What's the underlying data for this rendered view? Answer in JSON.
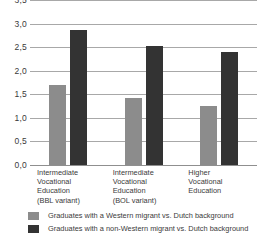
{
  "chart_data": {
    "type": "bar",
    "title": "",
    "xlabel": "",
    "ylabel": "",
    "ylim": [
      0,
      3.5
    ],
    "ytick_labels": [
      "3,5",
      "3,0",
      "2,5",
      "2,0",
      "1,5",
      "1,0",
      "0,5",
      "0,0"
    ],
    "ytick_values": [
      3.5,
      3.0,
      2.5,
      2.0,
      1.5,
      1.0,
      0.5,
      0.0
    ],
    "grid": true,
    "legend_position": "bottom",
    "decimal_separator": ",",
    "categories": [
      "Intermediate Vocational Education (BBL variant)",
      "Intermediate Vocational Education (BOL variant)",
      "Higher Vocational Education"
    ],
    "category_lines": [
      [
        "Intermediate",
        "Vocational",
        "Education",
        "(BBL variant)"
      ],
      [
        "Intermediate",
        "Vocational",
        "Education",
        "(BOL variant)"
      ],
      [
        "Higher",
        "Vocational",
        "Education"
      ]
    ],
    "series": [
      {
        "name": "Graduates with a Western migrant vs. Dutch background",
        "color": "#8c8c8c",
        "values": [
          1.7,
          1.42,
          1.25
        ]
      },
      {
        "name": "Graduates with a non-Western migrant vs. Dutch background",
        "color": "#333333",
        "values": [
          2.86,
          2.52,
          2.4
        ]
      }
    ]
  },
  "legend": {
    "items": [
      {
        "label": "Graduates with a Western migrant vs. Dutch background",
        "color": "#8c8c8c"
      },
      {
        "label": "Graduates with a non-Western migrant vs. Dutch background",
        "color": "#333333"
      }
    ]
  },
  "colors": {
    "gridline": "#a8a8a8",
    "text": "#3a3a3a",
    "background": "#ffffff"
  }
}
